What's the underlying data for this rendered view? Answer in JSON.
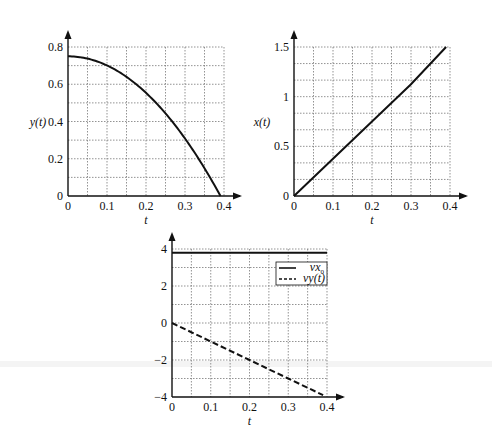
{
  "chart_data": [
    {
      "type": "line",
      "title": "",
      "xlabel": "t",
      "ylabel": "y(t)",
      "xlim": [
        0,
        0.4
      ],
      "ylim": [
        0,
        0.8
      ],
      "xticks": [
        "0",
        "0.1",
        "0.2",
        "0.3",
        "0.4"
      ],
      "yticks": [
        "0",
        "0.2",
        "0.4",
        "0.6",
        "0.8"
      ],
      "grid": true,
      "series": [
        {
          "name": "y(t)",
          "style": "solid",
          "x": [
            0,
            0.05,
            0.1,
            0.15,
            0.2,
            0.25,
            0.3,
            0.35,
            0.39
          ],
          "values": [
            0.75,
            0.74,
            0.7,
            0.64,
            0.55,
            0.44,
            0.31,
            0.15,
            0.0
          ]
        }
      ]
    },
    {
      "type": "line",
      "title": "",
      "xlabel": "t",
      "ylabel": "x(t)",
      "xlim": [
        0,
        0.4
      ],
      "ylim": [
        0,
        1.5
      ],
      "xticks": [
        "0",
        "0.1",
        "0.2",
        "0.3",
        "0.4"
      ],
      "yticks": [
        "0",
        "0.5",
        "1",
        "1.5"
      ],
      "grid": true,
      "series": [
        {
          "name": "x(t)",
          "style": "solid",
          "x": [
            0,
            0.1,
            0.2,
            0.3,
            0.39
          ],
          "values": [
            0,
            0.375,
            0.75,
            1.125,
            1.5
          ]
        }
      ]
    },
    {
      "type": "line",
      "title": "",
      "xlabel": "t",
      "ylabel": "",
      "xlim": [
        0,
        0.4
      ],
      "ylim": [
        -4,
        4
      ],
      "xticks": [
        "0",
        "0.1",
        "0.2",
        "0.3",
        "0.4"
      ],
      "yticks": [
        "-4",
        "-2",
        "0",
        "2",
        "4"
      ],
      "grid": true,
      "legend_position": "upper right",
      "series": [
        {
          "name": "vx0",
          "style": "solid",
          "x": [
            0,
            0.4
          ],
          "values": [
            3.8,
            3.8
          ]
        },
        {
          "name": "vy(t)",
          "style": "dashed",
          "x": [
            0,
            0.1,
            0.2,
            0.3,
            0.39
          ],
          "values": [
            0,
            -1,
            -2,
            -3,
            -3.9
          ]
        }
      ]
    }
  ],
  "labels": {
    "p1_ylabel": "y(t)",
    "p2_ylabel": "x(t)",
    "t": "t",
    "legend_vx": "vx",
    "legend_vx_sub": "0",
    "legend_vy": "vy(t)",
    "p1_yticks": [
      "0",
      "0.2",
      "0.4",
      "0.6",
      "0.8"
    ],
    "p2_yticks": [
      "0",
      "0.5",
      "1",
      "1.5"
    ],
    "p3_yticks": [
      "−4",
      "−2",
      "0",
      "2",
      "4"
    ],
    "xticks": [
      "0",
      "0.1",
      "0.2",
      "0.3",
      "0.4"
    ]
  }
}
